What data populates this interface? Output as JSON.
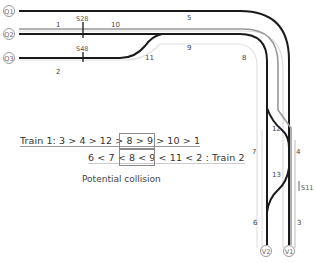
{
  "diagram": {
    "entry_nodes": [
      {
        "id": "Q1",
        "x": 9,
        "y": 11
      },
      {
        "id": "Q2",
        "x": 9,
        "y": 34
      },
      {
        "id": "Q3",
        "x": 9,
        "y": 58
      }
    ],
    "exit_nodes": [
      {
        "id": "V2",
        "x": 266,
        "y": 250
      },
      {
        "id": "V1",
        "x": 289,
        "y": 250
      }
    ],
    "segment_labels": [
      {
        "id": "1",
        "x": 58,
        "y": 27
      },
      {
        "id": "10",
        "x": 116,
        "y": 27
      },
      {
        "id": "5",
        "x": 189,
        "y": 20
      },
      {
        "id": "2",
        "x": 58,
        "y": 73
      },
      {
        "id": "11",
        "x": 149,
        "y": 59
      },
      {
        "id": "9",
        "x": 189,
        "y": 49
      },
      {
        "id": "8",
        "x": 242,
        "y": 59
      },
      {
        "id": "12",
        "x": 273,
        "y": 130
      },
      {
        "id": "7",
        "x": 253,
        "y": 153
      },
      {
        "id": "4",
        "x": 297,
        "y": 153
      },
      {
        "id": "13",
        "x": 273,
        "y": 176
      },
      {
        "id": "6",
        "x": 253,
        "y": 223
      },
      {
        "id": "3",
        "x": 297,
        "y": 223
      }
    ],
    "signals": [
      {
        "id": "S28",
        "x": 83,
        "y": 20
      },
      {
        "id": "S48",
        "x": 83,
        "y": 50
      },
      {
        "id": "S11",
        "x": 299,
        "y": 188
      }
    ],
    "colors": {
      "track_black": "#1a1a1a",
      "track_gray": "#9a9a9a",
      "track_light": "#d8d8d8",
      "box": "#8a8a8a"
    }
  },
  "annotations": {
    "train1_route": "Train 1: 3 > 4 > 12 > 8 > 9 > 10 > 1",
    "train2_route": "6 < 7 < 8 < 9 < 11 < 2 : Train 2",
    "conflict_train1": "8 > 9",
    "conflict_train2": "8 < 9",
    "caption": "Potential collision"
  }
}
